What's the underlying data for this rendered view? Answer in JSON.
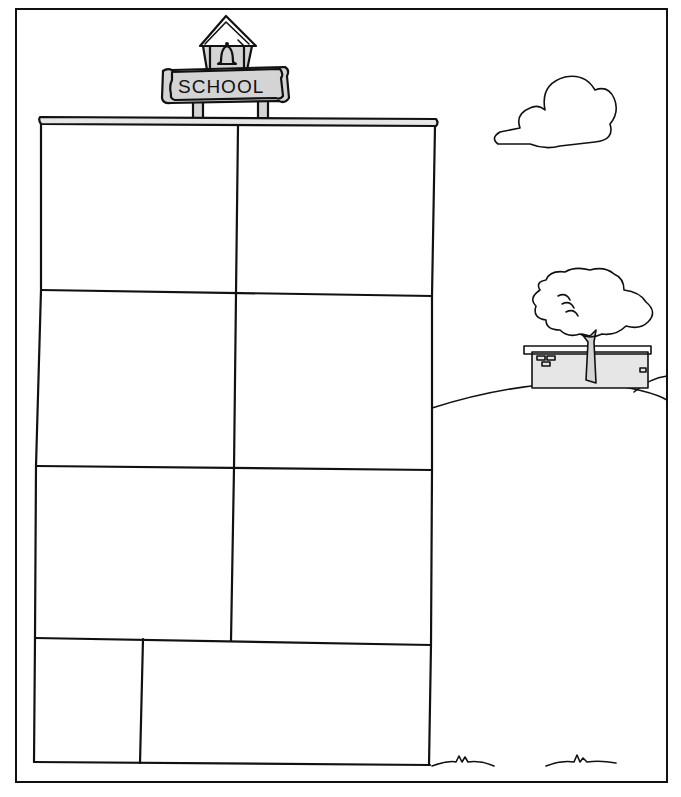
{
  "sign": {
    "label": "SCHOOL"
  },
  "colors": {
    "ink": "#111111",
    "background": "#ffffff",
    "shade": "#d4d4d4"
  },
  "panels": [
    {
      "id": 1,
      "row": 1,
      "col": 1
    },
    {
      "id": 2,
      "row": 1,
      "col": 2
    },
    {
      "id": 3,
      "row": 2,
      "col": 1
    },
    {
      "id": 4,
      "row": 2,
      "col": 2
    },
    {
      "id": 5,
      "row": 3,
      "col": 1
    },
    {
      "id": 6,
      "row": 3,
      "col": 2
    },
    {
      "id": 7,
      "row": 4,
      "col": 1
    },
    {
      "id": 8,
      "row": 4,
      "col": 2
    }
  ],
  "scene": {
    "elements": [
      "cloud",
      "tree",
      "small-building",
      "hill",
      "grass-tufts"
    ]
  }
}
